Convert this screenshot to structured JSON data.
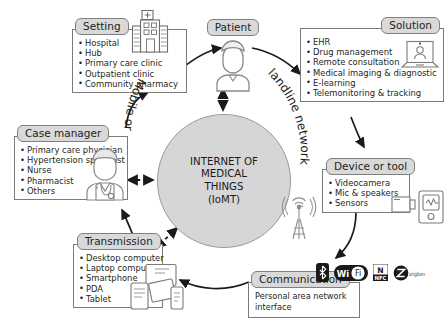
{
  "center": {
    "name": "iomt-circle",
    "line1": "INTERNET OF",
    "line2": "MEDICAL",
    "line3": "THINGS",
    "line4": "(IoMT)",
    "fill": "#d6d6d6"
  },
  "network_labels": {
    "left": "Mobile or",
    "right": "landline network"
  },
  "nodes": {
    "setting": {
      "label": "Setting",
      "icon": "hospital-icon",
      "items": [
        "Hospital",
        "Hub",
        "Primary care clinic",
        "Outpatient clinic",
        "Community pharmacy"
      ]
    },
    "patient": {
      "label": "Patient",
      "icon": "patient-person-icon"
    },
    "solution": {
      "label": "Solution",
      "icon": "laptop-video-consultation-icon",
      "items": [
        "EHR",
        "Drug management",
        "Remote consultation",
        "Medical imaging & diagnostic",
        "E-learning",
        "Telemonitoring & tracking"
      ]
    },
    "device_or_tool": {
      "label": "Device or tool",
      "icon": "camera-monitor-icon",
      "items": [
        "Videocamera",
        "Mic & speakers",
        "Sensors"
      ]
    },
    "communication": {
      "label": "Communication",
      "subtitle": "Personal area network interface",
      "badges": [
        "bluetooth-icon",
        "wifi-icon",
        "nfc-icon",
        "zigbee-icon"
      ],
      "badge_text": {
        "wifi_left": "Wi",
        "wifi_right": "Fi",
        "nfc_top": "N",
        "nfc_bottom": "NFC",
        "zigbee": "zigbee"
      }
    },
    "transmission": {
      "label": "Transmission",
      "icon": "devices-icon",
      "items": [
        "Desktop computer",
        "Laptop computer",
        "Smartphone",
        "PDA",
        "Tablet"
      ]
    },
    "case_manager": {
      "label": "Case manager",
      "icon": "doctor-icon",
      "items": [
        "Primary care physician",
        "Hypertension specialist",
        "Nurse",
        "Pharmacist",
        "Others"
      ]
    }
  },
  "tower": {
    "name": "cell-tower-icon"
  },
  "colors": {
    "pill_fill": "#d9d9d9",
    "pill_border": "#808080",
    "box_border": "#7a7a7a",
    "text": "#231f20",
    "arrow": "#1a1a1a"
  }
}
